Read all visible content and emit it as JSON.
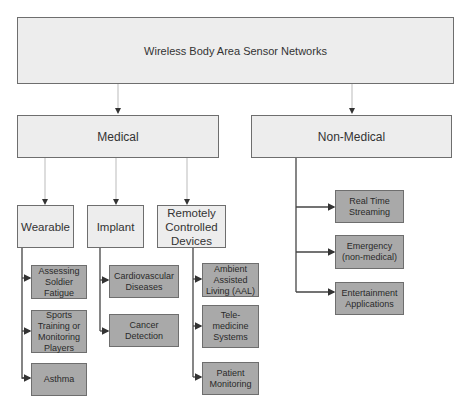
{
  "diagram": {
    "root": {
      "label": "Wireless Body Area Sensor Networks"
    },
    "medical": {
      "label": "Medical",
      "children": [
        {
          "label": "Wearable",
          "items": [
            "Assessing Soldier Fatigue",
            "Sports Training or Monitoring Players",
            "Asthma"
          ]
        },
        {
          "label": "Implant",
          "items": [
            "Cardiovascular Diseases",
            "Cancer Detection"
          ]
        },
        {
          "label": "Remotely Controlled Devices",
          "items": [
            "Ambient Assisted Living (AAL)",
            "Tele-medicine Systems",
            "Patient Monitoring"
          ]
        }
      ]
    },
    "non_medical": {
      "label": "Non-Medical",
      "items": [
        "Real Time Streaming",
        "Emergency (non-medical)",
        "Entertainment Applications"
      ]
    },
    "colors": {
      "light_box": "#ededed",
      "dark_box": "#a9a9a9",
      "border": "#6e6e6e",
      "connector": "#555555"
    }
  }
}
